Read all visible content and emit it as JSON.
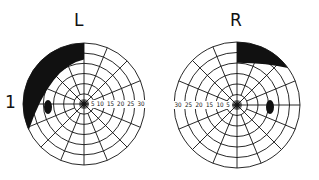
{
  "figure": {
    "row_label": "1",
    "ink_color": "#111111",
    "background": "#ffffff",
    "fields": [
      {
        "id": "left",
        "label": "L",
        "center": [
          84,
          104
        ],
        "radius": 61,
        "scale_labels": [
          "5",
          "10",
          "15",
          "20",
          "25",
          "30"
        ],
        "scale_direction": "right",
        "defect": "superior-temporal (upper-left) wedge scotoma",
        "blind_spot": {
          "cx": 48,
          "cy": 107,
          "rx": 4,
          "ry": 7
        }
      },
      {
        "id": "right",
        "label": "R",
        "center": [
          237,
          105
        ],
        "radius": 63,
        "scale_labels": [
          "5",
          "10",
          "15",
          "20",
          "25",
          "30"
        ],
        "scale_direction": "left",
        "defect": "superior-temporal (upper-right) wedge scotoma",
        "blind_spot": {
          "cx": 270,
          "cy": 107,
          "rx": 4,
          "ry": 7
        }
      }
    ],
    "rings": 6,
    "spokes": 16
  }
}
